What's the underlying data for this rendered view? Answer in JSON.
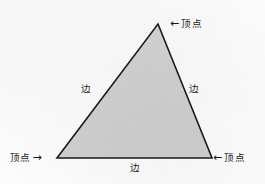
{
  "diagram": {
    "type": "triangle-geometry-labeled",
    "shape": {
      "name": "triangle",
      "fill_color": "#d3d3d3",
      "stroke_color": "#1a1a1a",
      "stroke_width": 1.6,
      "points": [
        {
          "name": "apex",
          "x": 158,
          "y": 24
        },
        {
          "name": "bottom-right",
          "x": 212,
          "y": 158
        },
        {
          "name": "bottom-left",
          "x": 57,
          "y": 158
        }
      ]
    },
    "background_color": "#fdfdfd",
    "text_color": "#232323"
  },
  "labels": {
    "vertex_top": {
      "arrow": "←",
      "text": "顶点"
    },
    "vertex_bottom_left": {
      "arrow": "→",
      "text": "顶点"
    },
    "vertex_bottom_right": {
      "arrow": "←",
      "text": "顶点"
    },
    "side_left": {
      "text": "边"
    },
    "side_right": {
      "text": "边"
    },
    "side_bottom": {
      "text": "边"
    }
  }
}
